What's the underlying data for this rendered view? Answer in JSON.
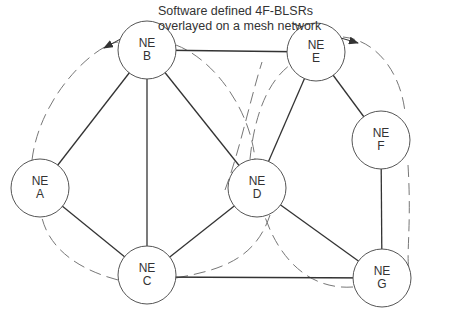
{
  "caption": {
    "line1": "Software defined 4F-BLSRs",
    "line2": "overlayed on a mesh network"
  },
  "nodes": [
    {
      "id": "A",
      "prefix": "NE",
      "label": "A",
      "x": 40,
      "y": 188
    },
    {
      "id": "B",
      "prefix": "NE",
      "label": "B",
      "x": 147,
      "y": 50
    },
    {
      "id": "C",
      "prefix": "NE",
      "label": "C",
      "x": 147,
      "y": 275
    },
    {
      "id": "D",
      "prefix": "NE",
      "label": "D",
      "x": 257,
      "y": 188
    },
    {
      "id": "E",
      "prefix": "NE",
      "label": "E",
      "x": 316,
      "y": 52
    },
    {
      "id": "F",
      "prefix": "NE",
      "label": "F",
      "x": 381,
      "y": 140
    },
    {
      "id": "G",
      "prefix": "NE",
      "label": "G",
      "x": 382,
      "y": 278
    }
  ],
  "links": [
    [
      "A",
      "B"
    ],
    [
      "A",
      "C"
    ],
    [
      "B",
      "C"
    ],
    [
      "B",
      "D"
    ],
    [
      "B",
      "E"
    ],
    [
      "C",
      "D"
    ],
    [
      "C",
      "G"
    ],
    [
      "D",
      "E"
    ],
    [
      "D",
      "G"
    ],
    [
      "E",
      "F"
    ],
    [
      "F",
      "G"
    ]
  ],
  "rings": [
    {
      "name": "left-ring",
      "nodes": [
        "A",
        "B",
        "D",
        "C"
      ]
    },
    {
      "name": "right-ring",
      "nodes": [
        "D",
        "E",
        "F",
        "G"
      ]
    }
  ],
  "colors": {
    "line": "#333333",
    "ring": "#777777",
    "node_fill": "#ffffff"
  }
}
